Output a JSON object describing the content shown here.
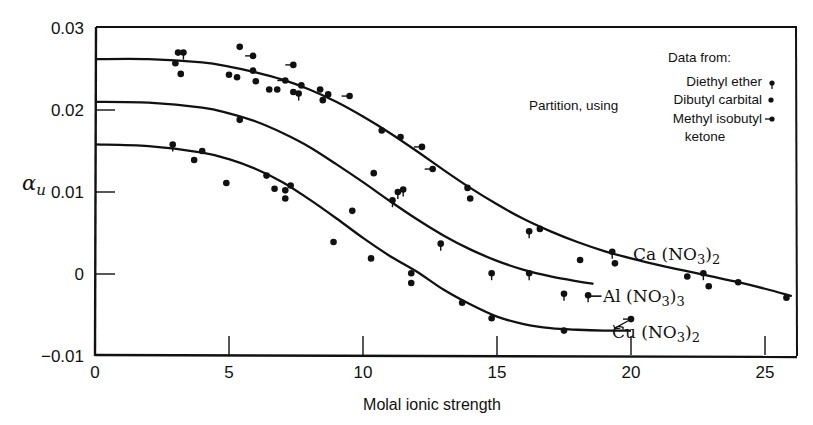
{
  "chart_data": {
    "type": "scatter",
    "title": "",
    "xlabel": "Molal ionic strength",
    "ylabel": "α_u",
    "xlim": [
      0,
      26
    ],
    "ylim": [
      -0.01,
      0.03
    ],
    "xticks": [
      0,
      5,
      10,
      15,
      20,
      25
    ],
    "xtick_labels": [
      "0",
      "5",
      "10",
      "15",
      "20",
      "25"
    ],
    "yticks": [
      -0.01,
      0,
      0.01,
      0.02,
      0.03
    ],
    "ytick_labels": [
      "−0.01",
      "0",
      "0.01",
      "0.02",
      "0.03"
    ],
    "grid": false,
    "annotation": "Partition, using",
    "legend": {
      "title": "Data from:",
      "position": "upper right",
      "entries": [
        {
          "label": "Diethyl ether",
          "marker": "dot-tail-down"
        },
        {
          "label": "Dibutyl carbital",
          "marker": "dot"
        },
        {
          "label": "Methyl isobutyl ketone",
          "marker": "dot-tail-left"
        }
      ]
    },
    "series": [
      {
        "name": "Ca (NO3)2",
        "label_parts": [
          "Ca (NO",
          "3",
          ")",
          "2"
        ],
        "curve": {
          "x": [
            0,
            2,
            4,
            5,
            6,
            7,
            8,
            9,
            10,
            11,
            12,
            13,
            14,
            15,
            16,
            17,
            18,
            19,
            20,
            21,
            22,
            23,
            24,
            25,
            26
          ],
          "y": [
            0.0262,
            0.0262,
            0.0258,
            0.0253,
            0.0246,
            0.0237,
            0.0225,
            0.021,
            0.0192,
            0.0172,
            0.015,
            0.0127,
            0.0105,
            0.0085,
            0.0067,
            0.0052,
            0.0039,
            0.0028,
            0.0019,
            0.0011,
            0.0004,
            -0.0003,
            -0.001,
            -0.0018,
            -0.0027
          ]
        },
        "points": [
          {
            "x": 3.0,
            "y": 0.0257,
            "m": "dot"
          },
          {
            "x": 3.1,
            "y": 0.027,
            "m": "dot"
          },
          {
            "x": 3.3,
            "y": 0.027,
            "m": "dot-tail-down"
          },
          {
            "x": 3.2,
            "y": 0.0244,
            "m": "dot"
          },
          {
            "x": 5.4,
            "y": 0.0277,
            "m": "dot"
          },
          {
            "x": 5.9,
            "y": 0.0266,
            "m": "dot-tail-left"
          },
          {
            "x": 5.0,
            "y": 0.0243,
            "m": "dot"
          },
          {
            "x": 5.3,
            "y": 0.024,
            "m": "dot"
          },
          {
            "x": 5.9,
            "y": 0.0248,
            "m": "dot"
          },
          {
            "x": 6.0,
            "y": 0.0235,
            "m": "dot"
          },
          {
            "x": 6.5,
            "y": 0.0225,
            "m": "dot"
          },
          {
            "x": 6.8,
            "y": 0.0225,
            "m": "dot"
          },
          {
            "x": 7.1,
            "y": 0.0236,
            "m": "dot-tail-left"
          },
          {
            "x": 7.4,
            "y": 0.0255,
            "m": "dot-tail-left"
          },
          {
            "x": 7.4,
            "y": 0.0222,
            "m": "dot"
          },
          {
            "x": 7.7,
            "y": 0.023,
            "m": "dot"
          },
          {
            "x": 7.6,
            "y": 0.022,
            "m": "dot-tail-down"
          },
          {
            "x": 8.4,
            "y": 0.0225,
            "m": "dot"
          },
          {
            "x": 8.7,
            "y": 0.0219,
            "m": "dot"
          },
          {
            "x": 8.5,
            "y": 0.0212,
            "m": "dot"
          },
          {
            "x": 9.5,
            "y": 0.0217,
            "m": "dot-tail-left"
          },
          {
            "x": 10.7,
            "y": 0.0175,
            "m": "dot"
          },
          {
            "x": 11.4,
            "y": 0.0167,
            "m": "dot"
          },
          {
            "x": 12.2,
            "y": 0.0155,
            "m": "dot-tail-left"
          },
          {
            "x": 12.6,
            "y": 0.0128,
            "m": "dot-tail-left"
          },
          {
            "x": 13.9,
            "y": 0.0105,
            "m": "dot"
          },
          {
            "x": 14.0,
            "y": 0.0092,
            "m": "dot"
          },
          {
            "x": 16.2,
            "y": 0.0052,
            "m": "dot-tail-down"
          },
          {
            "x": 16.6,
            "y": 0.0055,
            "m": "dot"
          },
          {
            "x": 18.1,
            "y": 0.0017,
            "m": "dot"
          },
          {
            "x": 19.3,
            "y": 0.0027,
            "m": "dot-tail-down"
          },
          {
            "x": 19.4,
            "y": 0.0013,
            "m": "dot"
          },
          {
            "x": 22.1,
            "y": -0.0003,
            "m": "dot"
          },
          {
            "x": 22.7,
            "y": 0.0001,
            "m": "dot-tail-down"
          },
          {
            "x": 22.9,
            "y": -0.0015,
            "m": "dot"
          },
          {
            "x": 24.0,
            "y": -0.001,
            "m": "dot"
          },
          {
            "x": 25.8,
            "y": -0.0029,
            "m": "dot"
          }
        ]
      },
      {
        "name": "Al (NO3)3",
        "label_parts": [
          "Al (NO",
          "3",
          ")",
          "3"
        ],
        "curve": {
          "x": [
            0,
            2,
            4,
            5,
            6,
            7,
            8,
            9,
            10,
            11,
            12,
            13,
            14,
            15,
            16,
            17,
            18,
            18.6
          ],
          "y": [
            0.021,
            0.0209,
            0.0203,
            0.0196,
            0.0186,
            0.0172,
            0.0155,
            0.0134,
            0.0112,
            0.0089,
            0.0067,
            0.0047,
            0.003,
            0.0016,
            0.0005,
            -0.0003,
            -0.0009,
            -0.0012
          ]
        },
        "points": [
          {
            "x": 5.4,
            "y": 0.0188,
            "m": "dot"
          },
          {
            "x": 10.4,
            "y": 0.0123,
            "m": "dot"
          },
          {
            "x": 9.6,
            "y": 0.0077,
            "m": "dot"
          },
          {
            "x": 11.1,
            "y": 0.009,
            "m": "dot-tail-down"
          },
          {
            "x": 11.3,
            "y": 0.01,
            "m": "dot-tail-down"
          },
          {
            "x": 11.5,
            "y": 0.0103,
            "m": "dot-tail-down"
          },
          {
            "x": 12.9,
            "y": 0.0037,
            "m": "dot-tail-down"
          },
          {
            "x": 14.8,
            "y": 0.0001,
            "m": "dot-tail-down"
          },
          {
            "x": 16.2,
            "y": 0.0001,
            "m": "dot-tail-down"
          },
          {
            "x": 17.5,
            "y": -0.0024,
            "m": "dot-tail-down"
          },
          {
            "x": 18.4,
            "y": -0.0026,
            "m": "dot-tail-down"
          }
        ]
      },
      {
        "name": "Cu (NO3)2",
        "label_parts": [
          "Cu (NO",
          "3",
          ")",
          "2"
        ],
        "curve": {
          "x": [
            0,
            2,
            4,
            5,
            6,
            7,
            8,
            9,
            10,
            11,
            12,
            13,
            14,
            15,
            16,
            17,
            18,
            19,
            20
          ],
          "y": [
            0.0158,
            0.0156,
            0.0148,
            0.014,
            0.0128,
            0.0112,
            0.0091,
            0.0068,
            0.0044,
            0.0022,
            0.0003,
            -0.0019,
            -0.0037,
            -0.0052,
            -0.0061,
            -0.0066,
            -0.0068,
            -0.0069,
            -0.0069
          ]
        },
        "points": [
          {
            "x": 2.9,
            "y": 0.0158,
            "m": "dot-tail-down"
          },
          {
            "x": 3.7,
            "y": 0.0139,
            "m": "dot"
          },
          {
            "x": 4.0,
            "y": 0.015,
            "m": "dot"
          },
          {
            "x": 4.9,
            "y": 0.0111,
            "m": "dot"
          },
          {
            "x": 6.4,
            "y": 0.012,
            "m": "dot"
          },
          {
            "x": 6.7,
            "y": 0.0104,
            "m": "dot"
          },
          {
            "x": 7.1,
            "y": 0.0102,
            "m": "dot"
          },
          {
            "x": 7.3,
            "y": 0.0108,
            "m": "dot"
          },
          {
            "x": 7.1,
            "y": 0.0092,
            "m": "dot"
          },
          {
            "x": 8.9,
            "y": 0.0039,
            "m": "dot"
          },
          {
            "x": 10.3,
            "y": 0.0019,
            "m": "dot"
          },
          {
            "x": 11.8,
            "y": 0.0001,
            "m": "dot"
          },
          {
            "x": 11.8,
            "y": -0.0011,
            "m": "dot"
          },
          {
            "x": 13.7,
            "y": -0.0035,
            "m": "dot"
          },
          {
            "x": 14.8,
            "y": -0.0054,
            "m": "dot"
          },
          {
            "x": 17.5,
            "y": -0.0069,
            "m": "dot"
          },
          {
            "x": 20.0,
            "y": -0.0055,
            "m": "dot-tail-left"
          }
        ]
      }
    ]
  }
}
